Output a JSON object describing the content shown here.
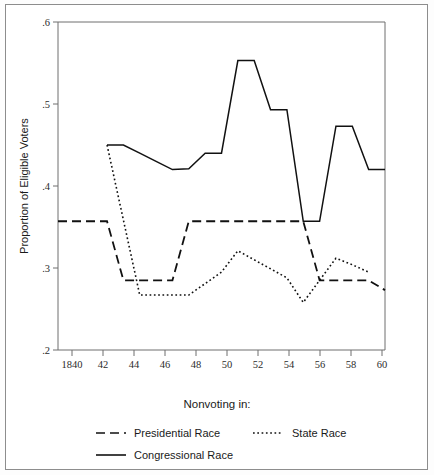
{
  "chart_data": {
    "type": "line",
    "title": "",
    "subtitle": "",
    "xlabel": "",
    "ylabel": "Proportion of Eligible Voters",
    "legend_title": "Nonvoting in:",
    "legend_position": "bottom",
    "grid": false,
    "xlim": [
      1840,
      1860
    ],
    "ylim": [
      0.2,
      0.6
    ],
    "x": [
      1840,
      1841,
      1842,
      1843,
      1844,
      1845,
      1846,
      1847,
      1848,
      1849,
      1850,
      1851,
      1852,
      1853,
      1854,
      1855,
      1856,
      1857,
      1858,
      1859,
      1860
    ],
    "xtick_values": [
      1840,
      1842,
      1844,
      1846,
      1848,
      1850,
      1852,
      1854,
      1856,
      1858,
      1860
    ],
    "xtick_labels": [
      "1840",
      "42",
      "44",
      "46",
      "48",
      "50",
      "52",
      "54",
      "56",
      "58",
      "60"
    ],
    "ytick_values": [
      0.2,
      0.3,
      0.4,
      0.5,
      0.6
    ],
    "ytick_labels": [
      ".2",
      ".3",
      ".4",
      ".5",
      ".6"
    ],
    "series": [
      {
        "name": "Presidential Race",
        "style": "dashed",
        "color": "#111111",
        "x": [
          1840,
          1843,
          1844,
          1847,
          1848,
          1855,
          1856,
          1859,
          1860
        ],
        "values": [
          0.357,
          0.357,
          0.285,
          0.285,
          0.357,
          0.357,
          0.285,
          0.285,
          0.273
        ]
      },
      {
        "name": "State Race",
        "style": "dotted",
        "color": "#111111",
        "x": [
          1843,
          1845,
          1847,
          1848,
          1849,
          1850,
          1851,
          1852,
          1853,
          1854,
          1855,
          1856,
          1857,
          1858,
          1859
        ],
        "values": [
          0.45,
          0.267,
          0.267,
          0.267,
          0.281,
          0.295,
          0.321,
          0.31,
          0.299,
          0.288,
          0.258,
          0.285,
          0.312,
          0.304,
          0.295
        ]
      },
      {
        "name": "Congressional Race",
        "style": "solid",
        "color": "#111111",
        "x": [
          1843,
          1844,
          1845,
          1846,
          1847,
          1848,
          1849,
          1850,
          1851,
          1852,
          1853,
          1854,
          1855,
          1856,
          1857,
          1858,
          1859,
          1860
        ],
        "values": [
          0.45,
          0.45,
          0.44,
          0.43,
          0.42,
          0.421,
          0.44,
          0.44,
          0.553,
          0.553,
          0.493,
          0.493,
          0.357,
          0.357,
          0.473,
          0.473,
          0.42,
          0.42
        ]
      }
    ]
  },
  "legend": {
    "title": "Nonvoting in:",
    "entries": [
      {
        "label": "Presidential Race",
        "style": "dashed"
      },
      {
        "label": "State Race",
        "style": "dotted"
      },
      {
        "label": "Congressional Race",
        "style": "solid"
      }
    ]
  },
  "axes": {
    "y_title": "Proportion of Eligible Voters",
    "y_ticks": [
      ".6",
      ".5",
      ".4",
      ".3",
      ".2"
    ],
    "x_ticks": [
      "1840",
      "42",
      "44",
      "46",
      "48",
      "50",
      "52",
      "54",
      "56",
      "58",
      "60"
    ]
  },
  "colors": {
    "line": "#111111",
    "axis": "#6f6f6f",
    "frame": "#8d8d8d",
    "background": "#ffffff"
  }
}
